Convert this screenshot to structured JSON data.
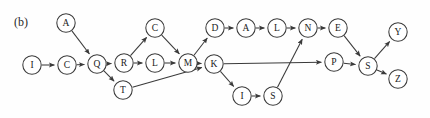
{
  "figure": {
    "panel_label": "(b)",
    "type": "directed-graph",
    "background_color": "#fefefe",
    "stroke_color": "#3a3a3a",
    "node_fill": "#ffffff",
    "node_radius": 9.2,
    "width": 430,
    "height": 118
  },
  "nodes": [
    {
      "id": "A1",
      "label": "A",
      "x": 66,
      "y": 23
    },
    {
      "id": "C1",
      "label": "C",
      "x": 155,
      "y": 28
    },
    {
      "id": "D1",
      "label": "D",
      "x": 215,
      "y": 28
    },
    {
      "id": "A2",
      "label": "A",
      "x": 246,
      "y": 28
    },
    {
      "id": "L1",
      "label": "L",
      "x": 277,
      "y": 28
    },
    {
      "id": "N1",
      "label": "N",
      "x": 308,
      "y": 28
    },
    {
      "id": "E1",
      "label": "E",
      "x": 338,
      "y": 28
    },
    {
      "id": "Y1",
      "label": "Y",
      "x": 398,
      "y": 32
    },
    {
      "id": "I1",
      "label": "I",
      "x": 32,
      "y": 65
    },
    {
      "id": "C2",
      "label": "C",
      "x": 67,
      "y": 65
    },
    {
      "id": "Q1",
      "label": "Q",
      "x": 97,
      "y": 64
    },
    {
      "id": "R1",
      "label": "R",
      "x": 124,
      "y": 63
    },
    {
      "id": "L2",
      "label": "L",
      "x": 155,
      "y": 63
    },
    {
      "id": "M1",
      "label": "M",
      "x": 188,
      "y": 63
    },
    {
      "id": "K1",
      "label": "K",
      "x": 214,
      "y": 64
    },
    {
      "id": "P1",
      "label": "P",
      "x": 334,
      "y": 62
    },
    {
      "id": "S1",
      "label": "S",
      "x": 368,
      "y": 66
    },
    {
      "id": "T1",
      "label": "T",
      "x": 123,
      "y": 90
    },
    {
      "id": "I2",
      "label": "I",
      "x": 242,
      "y": 96
    },
    {
      "id": "S2",
      "label": "S",
      "x": 273,
      "y": 96
    },
    {
      "id": "Z1",
      "label": "Z",
      "x": 398,
      "y": 79
    }
  ],
  "edges": [
    {
      "from": "A1",
      "to": "Q1"
    },
    {
      "from": "I1",
      "to": "C2"
    },
    {
      "from": "C2",
      "to": "Q1"
    },
    {
      "from": "Q1",
      "to": "R1"
    },
    {
      "from": "Q1",
      "to": "T1"
    },
    {
      "from": "R1",
      "to": "C1"
    },
    {
      "from": "R1",
      "to": "L2"
    },
    {
      "from": "C1",
      "to": "M1"
    },
    {
      "from": "L2",
      "to": "M1"
    },
    {
      "from": "M1",
      "to": "D1"
    },
    {
      "from": "M1",
      "to": "K1"
    },
    {
      "from": "T1",
      "to": "K1"
    },
    {
      "from": "D1",
      "to": "A2"
    },
    {
      "from": "A2",
      "to": "L1"
    },
    {
      "from": "L1",
      "to": "N1"
    },
    {
      "from": "N1",
      "to": "E1"
    },
    {
      "from": "K1",
      "to": "P1"
    },
    {
      "from": "K1",
      "to": "I2"
    },
    {
      "from": "I2",
      "to": "S2"
    },
    {
      "from": "S2",
      "to": "N1"
    },
    {
      "from": "E1",
      "to": "S1"
    },
    {
      "from": "P1",
      "to": "S1"
    },
    {
      "from": "S1",
      "to": "Y1"
    },
    {
      "from": "S1",
      "to": "Z1"
    }
  ]
}
